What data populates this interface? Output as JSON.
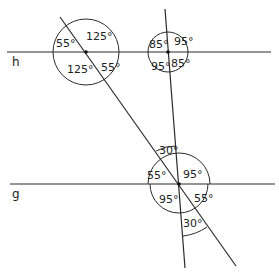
{
  "lines": {
    "h": {
      "label": "h"
    },
    "g": {
      "label": "g"
    }
  },
  "intersections": {
    "A": {
      "angles": {
        "top_left": "55°",
        "top_right": "125°",
        "bottom_left": "125°",
        "bottom_right": "55°"
      }
    },
    "B": {
      "angles": {
        "top_left": "85°",
        "top_right": "95°",
        "bottom_left": "95°",
        "bottom_right": "85°"
      }
    },
    "C": {
      "angles": {
        "top_between": "30°",
        "left": "55°",
        "top_right": "95°",
        "bottom_left": "95°",
        "bottom_right": "55°",
        "bottom_between": "30°"
      }
    }
  }
}
